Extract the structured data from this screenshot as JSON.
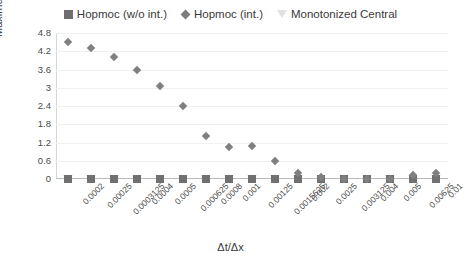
{
  "chart_data": {
    "type": "scatter",
    "title": "",
    "xlabel": "Δt/Δx",
    "ylabel": "Maximum error",
    "ylim": [
      0,
      4.8
    ],
    "yticks": [
      "0",
      "0.6",
      "1.2",
      "1.8",
      "2.4",
      "3",
      "3.6",
      "4.2",
      "4.8"
    ],
    "ytick_values": [
      0,
      0.6,
      1.2,
      1.8,
      2.4,
      3,
      3.6,
      4.2,
      4.8
    ],
    "grid": true,
    "legend_position": "top",
    "categories": [
      "0.0002",
      "0.00025",
      "0.0003125",
      "0.0004",
      "0.0005",
      "0.000625",
      "0.0008",
      "0.001",
      "0.00125",
      "0.0015625",
      "0.002",
      "0.0025",
      "0.003125",
      "0.004",
      "0.005",
      "0.00625",
      "0.01"
    ],
    "series": [
      {
        "name": "Hopmoc (w/o int.)",
        "marker": "square",
        "color": "#707070",
        "values": [
          0,
          0,
          0,
          0,
          0,
          0,
          0,
          0,
          0,
          0,
          0,
          0,
          0,
          0,
          0,
          0,
          0
        ]
      },
      {
        "name": "Hopmoc (int.)",
        "marker": "diamond",
        "color": "#808080",
        "values": [
          4.5,
          4.3,
          4.0,
          3.6,
          3.05,
          2.4,
          1.4,
          1.05,
          1.1,
          0.6,
          0.2,
          0.05,
          0.0,
          0.0,
          0.0,
          0.12,
          0.2
        ]
      },
      {
        "name": "Monotonized Central",
        "marker": "triangle",
        "color": "#e4e4e4",
        "values": [
          0,
          0,
          0,
          0,
          0,
          0,
          0,
          0,
          0,
          0,
          0,
          0,
          0,
          0,
          0,
          0,
          0
        ]
      }
    ]
  },
  "legend": {
    "items": [
      {
        "label": "Hopmoc (w/o int.)",
        "marker": "square-marker-icon"
      },
      {
        "label": "Hopmoc (int.)",
        "marker": "diamond-marker-icon"
      },
      {
        "label": "Monotonized Central",
        "marker": "triangle-marker-icon"
      }
    ]
  },
  "axes": {
    "y_title": "Maximum error",
    "x_title": "Δt/Δx"
  }
}
